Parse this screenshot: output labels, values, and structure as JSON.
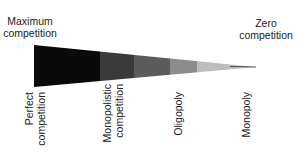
{
  "diagram": {
    "left_label": [
      "Maximum",
      "competition"
    ],
    "right_label": [
      "Zero",
      "competition"
    ],
    "segments": [
      {
        "name": "Perfect competition",
        "lines": [
          "Perfect",
          "competition"
        ],
        "color": "#0a0a0a"
      },
      {
        "name": "Monopolistic competition",
        "lines": [
          "Monopolistic",
          "competition"
        ],
        "color": "#3a3a3a"
      },
      {
        "name": "Oligopoly-dark",
        "color": "#5c5c5c"
      },
      {
        "name": "Oligopoly",
        "lines": [
          "Oligopoly"
        ],
        "color": "#8c8c8c"
      },
      {
        "name": "Monopoly",
        "lines": [
          "Monopoly"
        ],
        "color": "#bdbdbd"
      }
    ]
  }
}
